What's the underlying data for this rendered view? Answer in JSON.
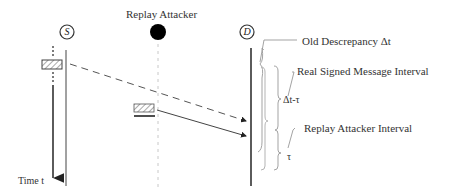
{
  "diagram": {
    "type": "sequence-timing",
    "nodes": {
      "source": {
        "letter": "S"
      },
      "attacker": {
        "label": "Replay Attacker"
      },
      "destination": {
        "letter": "D"
      }
    },
    "time_axis": {
      "label": "Time t"
    },
    "messages": [
      {
        "from": "source",
        "to": "destination",
        "style": "dashed",
        "description": "real signed message"
      },
      {
        "from": "attacker",
        "to": "destination",
        "style": "solid",
        "description": "replayed message"
      }
    ],
    "annotations": {
      "old_discrepancy": "Old Descrepancy Δt",
      "real_interval": "Real Signed Message Interval",
      "delta_minus_tau": "Δt-τ",
      "replay_interval": "Replay Attacker Interval",
      "tau": "τ"
    },
    "colors": {
      "line": "#333333",
      "lifeline_dashed": "#c8c8c8",
      "bracket": "#888888",
      "attacker_dot": "#000000"
    }
  }
}
